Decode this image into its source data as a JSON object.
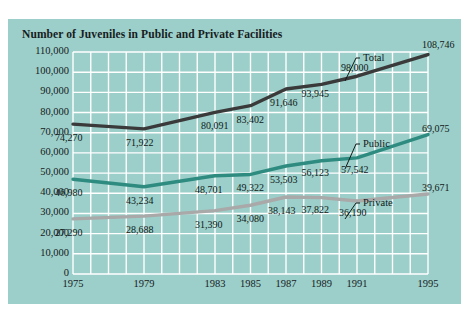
{
  "chart_data": {
    "type": "line",
    "title": "Number of Juveniles in Public and Private Facilities",
    "xlabel": "",
    "ylabel": "",
    "grid": true,
    "legend_position": "inline-callout",
    "xlim": [
      1975,
      1995
    ],
    "ylim": [
      0,
      110000
    ],
    "x_tick_labels": [
      "1975",
      "1979",
      "1983",
      "1985",
      "1987",
      "1989",
      "1991",
      "1995"
    ],
    "x_ticks": [
      1975,
      1979,
      1983,
      1985,
      1987,
      1989,
      1991,
      1995
    ],
    "y_tick_labels": [
      "0",
      "10,000",
      "20,000",
      "30,000",
      "40,000",
      "50,000",
      "60,000",
      "70,000",
      "80,000",
      "90,000",
      "100,000",
      "110,000"
    ],
    "y_ticks": [
      0,
      10000,
      20000,
      30000,
      40000,
      50000,
      60000,
      70000,
      80000,
      90000,
      100000,
      110000
    ],
    "x": [
      1975,
      1979,
      1983,
      1985,
      1987,
      1989,
      1991,
      1995
    ],
    "series": [
      {
        "name": "Total",
        "color": "#3a3a3a",
        "values": [
          74270,
          71922,
          80091,
          83402,
          91646,
          93945,
          98000,
          108746
        ],
        "labels": [
          "74,270",
          "71,922",
          "80,091",
          "83,402",
          "91,646",
          "93,945",
          "98,000",
          "108,746"
        ]
      },
      {
        "name": "Public",
        "color": "#2e8b80",
        "values": [
          46980,
          43234,
          48701,
          49322,
          53503,
          56123,
          57542,
          69075
        ],
        "labels": [
          "46,980",
          "43,234",
          "48,701",
          "49,322",
          "53,503",
          "56,123",
          "57,542",
          "69,075"
        ]
      },
      {
        "name": "Private",
        "color": "#a9a9a9",
        "values": [
          27290,
          28688,
          31390,
          34080,
          38143,
          37822,
          36190,
          39671
        ],
        "labels": [
          "27,290",
          "28,688",
          "31,390",
          "34,080",
          "38,143",
          "37,822",
          "36,190",
          "39,671"
        ]
      }
    ],
    "colors": {
      "panel_background": "#9ccfc9",
      "page_background": "#ffffff",
      "gridline": "#ffffff",
      "text": "#16201f",
      "total_line": "#3a3a3a",
      "public_line": "#2e8b80",
      "private_line": "#a9a9a9"
    }
  }
}
